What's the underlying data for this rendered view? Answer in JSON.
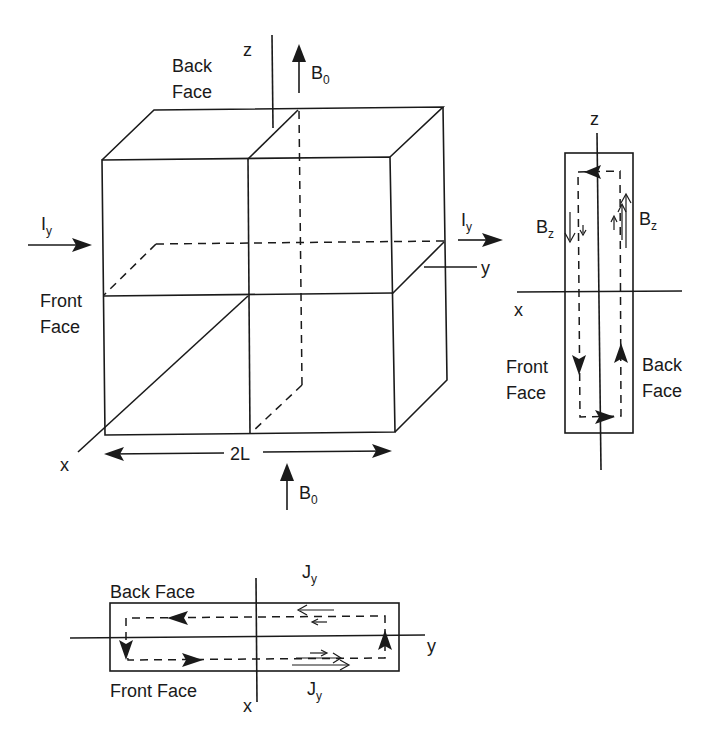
{
  "figure": {
    "cube": {
      "axis_z": "z",
      "axis_y": "y",
      "axis_x": "x",
      "back_face_line1": "Back",
      "back_face_line2": "Face",
      "front_face_line1": "Front",
      "front_face_line2": "Face",
      "current_in": "I",
      "current_in_sub": "y",
      "current_out": "I",
      "current_out_sub": "y",
      "field_top": "B",
      "field_top_sub": "0",
      "field_bottom": "B",
      "field_bottom_sub": "0",
      "width_label": "2L"
    },
    "side_view": {
      "axis_z": "z",
      "axis_x": "x",
      "bz_left": "B",
      "bz_left_sub": "z",
      "bz_right": "B",
      "bz_right_sub": "z",
      "front_line1": "Front",
      "front_line2": "Face",
      "back_line1": "Back",
      "back_line2": "Face"
    },
    "top_view": {
      "back_face": "Back Face",
      "front_face": "Front Face",
      "axis_y": "y",
      "axis_x": "x",
      "j_top": "J",
      "j_top_sub": "y",
      "j_bottom": "J",
      "j_bottom_sub": "y"
    }
  }
}
